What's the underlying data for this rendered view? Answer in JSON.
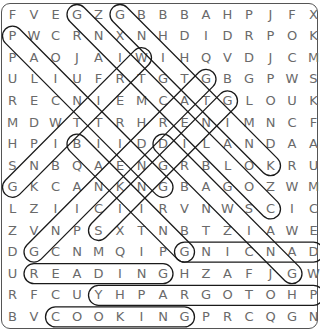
{
  "puzzle": {
    "rows": 15,
    "cols": 15,
    "grid": [
      "FVEGZGBBBAHPJFX",
      "PWCRNXNHDIDRPOK",
      "PAOJAIWIHQVDJCM",
      "ULIUFRTGTGBGPWS",
      "RECNIEMCATGLOUK",
      "MDWTTRHRENIMNCF",
      "HPIBIIDDILANDAA",
      "SNBQAENGRBLOKRU",
      "GKCANKNGBAGOZWM",
      "LZIICIIRVNWSCIC",
      "ZVNPSXTNBTZIAWE",
      "DGCNMQIPGNICNAD",
      "UREADINGHZAFJGW",
      "RFCUYHPARGOTOHP",
      "BVCOOKINGPRCQGN"
    ],
    "found_words": [
      {
        "word": "READING",
        "start": [
          13,
          2
        ],
        "end": [
          13,
          8
        ]
      },
      {
        "word": "COOKING",
        "start": [
          15,
          3
        ],
        "end": [
          15,
          9
        ]
      },
      {
        "word": "PHOTOGRAPHY",
        "start": [
          14,
          15
        ],
        "end": [
          14,
          5
        ]
      },
      {
        "word": "DANCING",
        "start": [
          12,
          15
        ],
        "end": [
          12,
          9
        ]
      },
      {
        "word": "KNITTING",
        "start": [
          8,
          13
        ],
        "end": [
          1,
          6
        ]
      },
      {
        "word": "COLLECTING",
        "start": [
          10,
          13
        ],
        "end": [
          1,
          4
        ]
      },
      {
        "word": "PAINTING",
        "start": [
          2,
          1
        ],
        "end": [
          9,
          8
        ]
      },
      {
        "word": "DRAWING",
        "start": [
          7,
          8
        ],
        "end": [
          13,
          14
        ]
      },
      {
        "word": "BAKING",
        "start": [
          7,
          4
        ],
        "end": [
          12,
          9
        ]
      },
      {
        "word": "WRITING",
        "start": [
          3,
          7
        ],
        "end": [
          9,
          1
        ]
      },
      {
        "word": "GARDENING",
        "start": [
          12,
          2
        ],
        "end": [
          4,
          10
        ]
      },
      {
        "word": "SINGING",
        "start": [
          11,
          5
        ],
        "end": [
          5,
          11
        ]
      }
    ]
  },
  "colors": {
    "letter": "#6a6a6a",
    "loop_stroke": "#1a1a1a",
    "border": "#555555"
  }
}
